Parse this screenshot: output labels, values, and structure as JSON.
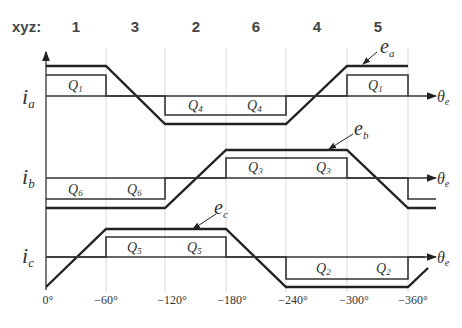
{
  "header": {
    "label": "xyz:",
    "sectors": [
      "1",
      "3",
      "2",
      "6",
      "4",
      "5"
    ]
  },
  "axes": {
    "x_symbol": "θ",
    "x_subscript": "e",
    "x_ticks": [
      "0°",
      "−60°",
      "−120°",
      "−180°",
      "−240°",
      "−300°",
      "−360°"
    ]
  },
  "phases": [
    {
      "current_symbol": "i",
      "current_subscript": "a",
      "emf_symbol": "e",
      "emf_subscript": "a",
      "switch_labels": [
        {
          "name": "Q",
          "sub": "1"
        },
        {
          "name": "Q",
          "sub": "4"
        },
        {
          "name": "Q",
          "sub": "4"
        },
        {
          "name": "Q",
          "sub": "1"
        }
      ]
    },
    {
      "current_symbol": "i",
      "current_subscript": "b",
      "emf_symbol": "e",
      "emf_subscript": "b",
      "switch_labels": [
        {
          "name": "Q",
          "sub": "6"
        },
        {
          "name": "Q",
          "sub": "6"
        },
        {
          "name": "Q",
          "sub": "3"
        },
        {
          "name": "Q",
          "sub": "3"
        }
      ]
    },
    {
      "current_symbol": "i",
      "current_subscript": "c",
      "emf_symbol": "e",
      "emf_subscript": "c",
      "switch_labels": [
        {
          "name": "Q",
          "sub": "5"
        },
        {
          "name": "Q",
          "sub": "5"
        },
        {
          "name": "Q",
          "sub": "2"
        },
        {
          "name": "Q",
          "sub": "2"
        }
      ]
    }
  ],
  "colors": {
    "line": "#222222",
    "grid": "#cfcfcf",
    "text": "#333333"
  }
}
